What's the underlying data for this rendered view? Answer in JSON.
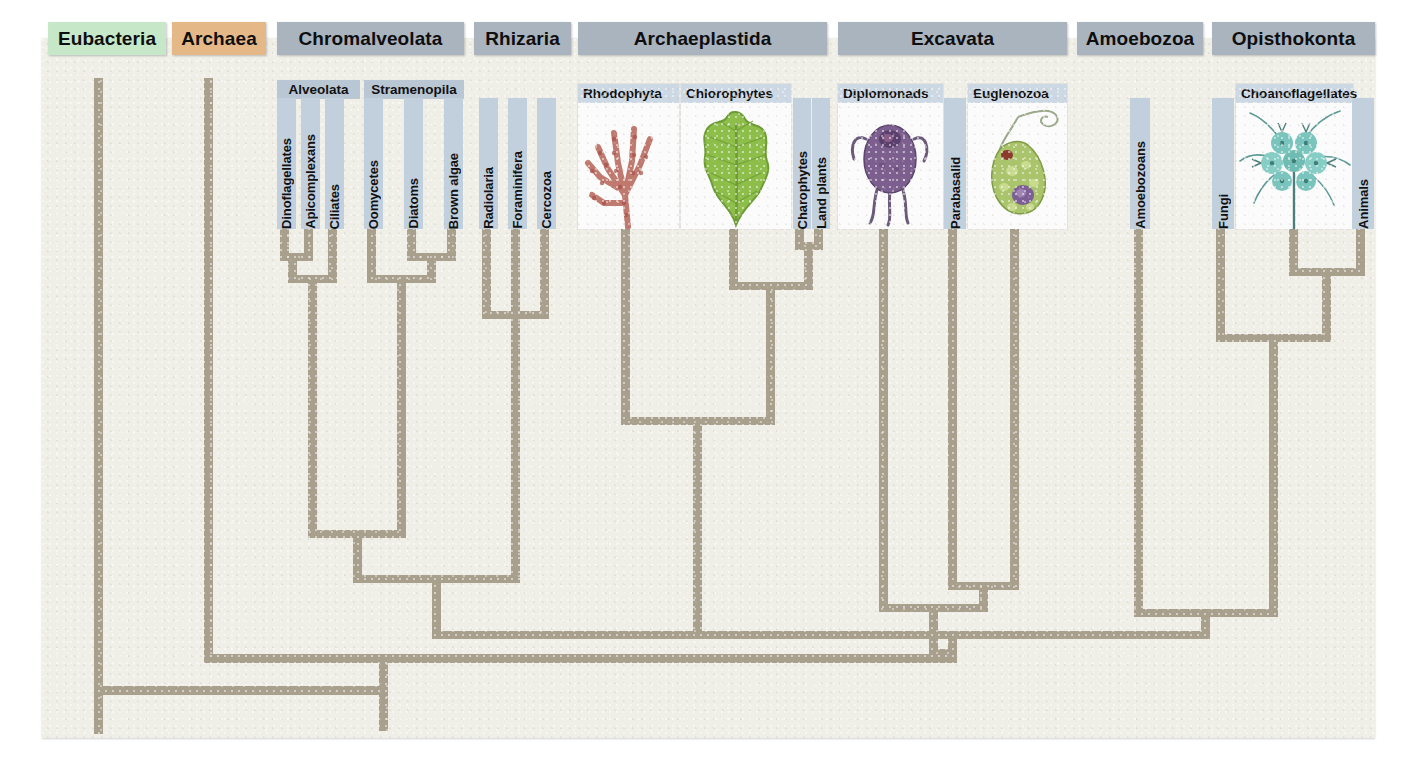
{
  "diagram": {
    "type": "phylogenetic-tree",
    "branch_color": "#a99f8d",
    "canvas_color": "#efeee7"
  },
  "clades": [
    {
      "label": "Eubacteria",
      "style": "green",
      "x": 48,
      "w": 118
    },
    {
      "label": "Archaea",
      "style": "tan",
      "x": 172,
      "w": 94
    },
    {
      "label": "Chromalveolata",
      "style": "grey",
      "x": 277,
      "w": 187
    },
    {
      "label": "Rhizaria",
      "style": "grey",
      "x": 474,
      "w": 97
    },
    {
      "label": "Archaeplastida",
      "style": "grey",
      "x": 578,
      "w": 249
    },
    {
      "label": "Excavata",
      "style": "grey",
      "x": 838,
      "w": 229
    },
    {
      "label": "Amoebozoa",
      "style": "grey",
      "x": 1077,
      "w": 126
    },
    {
      "label": "Opisthokonta",
      "style": "grey",
      "x": 1212,
      "w": 163
    }
  ],
  "subgroups": [
    {
      "label": "Alveolata",
      "x": 277,
      "w": 83,
      "light": false
    },
    {
      "label": "Stramenopila",
      "x": 364,
      "w": 100,
      "light": false
    },
    {
      "label": "Rhodophyta",
      "x": 578,
      "w": 101,
      "light": true
    },
    {
      "label": "Chlorophytes",
      "x": 681,
      "w": 108,
      "light": true
    },
    {
      "label": "Diplomonads",
      "x": 838,
      "w": 105,
      "light": true
    },
    {
      "label": "Euglenozoa",
      "x": 971,
      "w": 96,
      "light": true
    },
    {
      "label": "Choanoflagellates",
      "x": 1240,
      "w": 118,
      "light": true
    }
  ],
  "taxa": [
    {
      "label": "Dinoflagellates",
      "x": 277,
      "w": 19,
      "top": 98,
      "h": 131
    },
    {
      "label": "Apicomplexans",
      "x": 301,
      "w": 19,
      "top": 98,
      "h": 131
    },
    {
      "label": "Ciliates",
      "x": 325,
      "w": 19,
      "top": 98,
      "h": 131
    },
    {
      "label": "Oomycetes",
      "x": 364,
      "w": 19,
      "top": 98,
      "h": 131
    },
    {
      "label": "Diatoms",
      "x": 404,
      "w": 19,
      "top": 98,
      "h": 131
    },
    {
      "label": "Brown algae",
      "x": 444,
      "w": 19,
      "top": 98,
      "h": 131
    },
    {
      "label": "Radiolaria",
      "x": 479,
      "w": 19,
      "top": 98,
      "h": 131
    },
    {
      "label": "Foraminifera",
      "x": 508,
      "w": 19,
      "top": 98,
      "h": 131
    },
    {
      "label": "Cercozoa",
      "x": 537,
      "w": 19,
      "top": 98,
      "h": 131
    },
    {
      "label": "Charophytes",
      "x": 793,
      "w": 18,
      "top": 98,
      "h": 131
    },
    {
      "label": "Land plants",
      "x": 812,
      "w": 18,
      "top": 98,
      "h": 131
    },
    {
      "label": "Parabasalid",
      "x": 944,
      "w": 22,
      "top": 98,
      "h": 131
    },
    {
      "label": "Amoebozoans",
      "x": 1130,
      "w": 20,
      "top": 98,
      "h": 131
    },
    {
      "label": "Fungi",
      "x": 1212,
      "w": 22,
      "top": 98,
      "h": 131
    },
    {
      "label": "Animals",
      "x": 1352,
      "w": 22,
      "top": 98,
      "h": 131
    }
  ],
  "photos": [
    {
      "caption": "Rhodophyta",
      "art": "red-alga-illustration",
      "x": 578,
      "y": 98,
      "w": 101,
      "h": 131
    },
    {
      "caption": "Chlorophytes",
      "art": "green-alga-leaf-illustration",
      "x": 681,
      "y": 98,
      "w": 110,
      "h": 131
    },
    {
      "caption": "Diplomonads",
      "art": "giardia-illustration",
      "x": 838,
      "y": 98,
      "w": 105,
      "h": 131
    },
    {
      "caption": "Euglenozoa",
      "art": "euglena-illustration",
      "x": 968,
      "y": 98,
      "w": 99,
      "h": 131
    },
    {
      "caption": "Choanoflagellates",
      "art": "choanoflagellate-colony-illustration",
      "x": 1236,
      "y": 84,
      "w": 117,
      "h": 145
    }
  ],
  "chart_data": {
    "type": "tree",
    "root_x": 383,
    "leaves": [
      {
        "name": "Eubacteria",
        "x": 100
      },
      {
        "name": "Archaea",
        "x": 210
      },
      {
        "name": "Dinoflagellates",
        "x": 286
      },
      {
        "name": "Apicomplexans",
        "x": 310
      },
      {
        "name": "Ciliates",
        "x": 334
      },
      {
        "name": "Oomycetes",
        "x": 373
      },
      {
        "name": "Diatoms",
        "x": 413
      },
      {
        "name": "Brown algae",
        "x": 453
      },
      {
        "name": "Radiolaria",
        "x": 488
      },
      {
        "name": "Foraminifera",
        "x": 517
      },
      {
        "name": "Cercozoa",
        "x": 546
      },
      {
        "name": "Rhodophyta",
        "x": 627
      },
      {
        "name": "Chlorophytes",
        "x": 735
      },
      {
        "name": "Charophytes",
        "x": 801
      },
      {
        "name": "Land plants",
        "x": 820
      },
      {
        "name": "Diplomonads",
        "x": 885
      },
      {
        "name": "Parabasalid",
        "x": 954
      },
      {
        "name": "Euglenozoa",
        "x": 1016
      },
      {
        "name": "Amoebozoans",
        "x": 1140
      },
      {
        "name": "Fungi",
        "x": 1222
      },
      {
        "name": "Choanoflagellates",
        "x": 1295
      },
      {
        "name": "Animals",
        "x": 1362
      }
    ],
    "nodes": [
      {
        "name": "dinoflagellates+apicomplexans",
        "y": 257,
        "children_x": [
          286,
          310
        ]
      },
      {
        "name": "alveolata",
        "y": 279,
        "children_x": [
          298,
          334
        ]
      },
      {
        "name": "diatoms+brown-algae",
        "y": 257,
        "children_x": [
          413,
          453
        ]
      },
      {
        "name": "stramenopila",
        "y": 279,
        "children_x": [
          373,
          433
        ]
      },
      {
        "name": "chromalveolata",
        "y": 534,
        "children_x": [
          316,
          403
        ]
      },
      {
        "name": "rhizaria",
        "y": 319,
        "children_x": [
          488,
          546
        ]
      },
      {
        "name": "chromalveolata+rhizaria",
        "y": 583,
        "children_x": [
          359,
          517
        ]
      },
      {
        "name": "charophytes+land-plants",
        "y": 250,
        "children_x": [
          801,
          820
        ]
      },
      {
        "name": "green-plants",
        "y": 290,
        "children_x": [
          735,
          810
        ]
      },
      {
        "name": "archaeplastida",
        "y": 425,
        "children_x": [
          627,
          772
        ]
      },
      {
        "name": "excavata-euglenozoa-parabasalid",
        "y": 590,
        "children_x": [
          954,
          1016
        ]
      },
      {
        "name": "excavata",
        "y": 612,
        "children_x": [
          885,
          985
        ]
      },
      {
        "name": "unikonts-opisthokonta-deep",
        "y": 272,
        "children_x": [
          1295,
          1362
        ]
      },
      {
        "name": "opisthokonta",
        "y": 338,
        "children_x": [
          1222,
          1328
        ]
      },
      {
        "name": "amoebozoa+opisthokonta",
        "y": 617,
        "children_x": [
          1140,
          1275
        ]
      },
      {
        "name": "bikonts+unikonts",
        "y": 643,
        "children_x": [
          699,
          1207
        ]
      },
      {
        "name": "eukaryotes",
        "y": 661,
        "children_x": [
          210,
          953
        ]
      },
      {
        "name": "root",
        "y": 693,
        "children_x": [
          100,
          581
        ]
      }
    ]
  }
}
